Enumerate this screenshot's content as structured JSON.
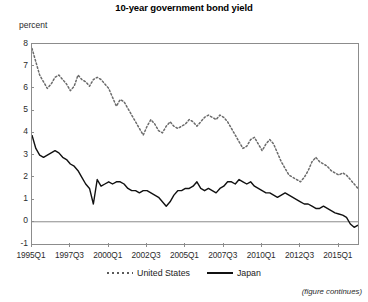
{
  "chart_data": {
    "type": "line",
    "title": "10-year government bond yield",
    "ylabel": "percent",
    "xlabel": "",
    "ylim": [
      -1,
      8
    ],
    "ytick_labels": [
      "8",
      "7",
      "6",
      "5",
      "4",
      "3",
      "2",
      "1",
      "0",
      "-1"
    ],
    "ytick_values": [
      8,
      7,
      6,
      5,
      4,
      3,
      2,
      1,
      0,
      -1
    ],
    "grid": false,
    "zero_line": true,
    "legend_position": "bottom",
    "note": "(figure continues)",
    "xtick_labels": [
      "1995Q1",
      "1997Q3",
      "2000Q1",
      "2002Q3",
      "2005Q1",
      "2007Q3",
      "2010Q1",
      "2012Q3",
      "2015Q1"
    ],
    "xtick_indices": [
      0,
      10,
      20,
      30,
      40,
      50,
      60,
      70,
      80
    ],
    "x_index_range": [
      0,
      85
    ],
    "series": [
      {
        "name": "United States",
        "style": "dotted",
        "color": "#6b6b6b",
        "values": [
          7.8,
          7.2,
          6.6,
          6.3,
          6.0,
          6.2,
          6.5,
          6.6,
          6.4,
          6.2,
          5.9,
          6.1,
          6.6,
          6.4,
          6.3,
          6.1,
          6.4,
          6.5,
          6.4,
          6.2,
          6.0,
          5.6,
          5.2,
          5.5,
          5.4,
          5.1,
          4.8,
          4.5,
          4.2,
          3.9,
          4.3,
          4.6,
          4.4,
          4.1,
          4.0,
          4.3,
          4.5,
          4.3,
          4.2,
          4.3,
          4.4,
          4.6,
          4.5,
          4.3,
          4.5,
          4.7,
          4.8,
          4.7,
          4.6,
          4.8,
          4.7,
          4.5,
          4.2,
          3.9,
          3.6,
          3.3,
          3.4,
          3.7,
          3.8,
          3.5,
          3.2,
          3.5,
          3.7,
          3.5,
          3.1,
          2.7,
          2.4,
          2.1,
          2.0,
          1.9,
          1.8,
          2.0,
          2.3,
          2.7,
          2.9,
          2.7,
          2.6,
          2.5,
          2.3,
          2.2,
          2.1,
          2.2,
          2.1,
          1.9,
          1.7,
          1.5
        ]
      },
      {
        "name": "Japan",
        "style": "solid",
        "color": "#111111",
        "values": [
          3.9,
          3.3,
          3.0,
          2.9,
          3.0,
          3.1,
          3.2,
          3.1,
          2.9,
          2.8,
          2.6,
          2.5,
          2.3,
          2.0,
          1.7,
          1.5,
          0.8,
          1.9,
          1.6,
          1.7,
          1.8,
          1.7,
          1.8,
          1.8,
          1.7,
          1.5,
          1.4,
          1.4,
          1.3,
          1.4,
          1.4,
          1.3,
          1.2,
          1.1,
          0.9,
          0.7,
          0.9,
          1.2,
          1.4,
          1.4,
          1.5,
          1.5,
          1.6,
          1.8,
          1.5,
          1.4,
          1.5,
          1.4,
          1.3,
          1.5,
          1.6,
          1.8,
          1.8,
          1.7,
          1.9,
          1.8,
          1.7,
          1.8,
          1.6,
          1.5,
          1.4,
          1.3,
          1.3,
          1.2,
          1.1,
          1.2,
          1.3,
          1.2,
          1.1,
          1.0,
          0.9,
          0.8,
          0.8,
          0.7,
          0.6,
          0.6,
          0.7,
          0.6,
          0.5,
          0.4,
          0.35,
          0.3,
          0.2,
          -0.1,
          -0.25,
          -0.15
        ]
      }
    ]
  }
}
